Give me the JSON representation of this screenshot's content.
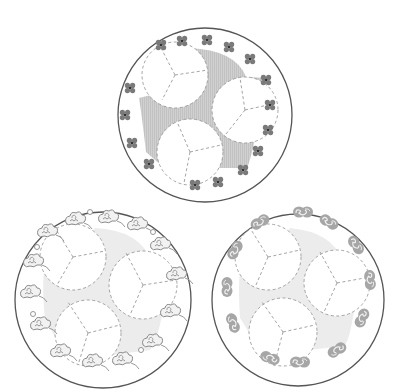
{
  "figure": {
    "colors": {
      "plate_outline": "#555555",
      "dashed_line": "#9a9a9a",
      "shade_top": "#c8c8c8",
      "shade_bottom": "#ececec",
      "motif": "#8a8a8a",
      "motif_dark": "#555555"
    },
    "plates": [
      {
        "id": "top",
        "cx": 205,
        "cy": 115,
        "r": 87,
        "motif": "four-petal-flower",
        "motif_count": 18,
        "shading": "hatched-gray"
      },
      {
        "id": "bottom-left",
        "cx": 103,
        "cy": 300,
        "r": 88,
        "motif": "auspicious-cloud",
        "motif_count": 14,
        "shading": "light-gray"
      },
      {
        "id": "bottom-right",
        "cx": 298,
        "cy": 300,
        "r": 86,
        "motif": "s-scroll",
        "motif_count": 14,
        "shading": "light-gray"
      }
    ]
  }
}
